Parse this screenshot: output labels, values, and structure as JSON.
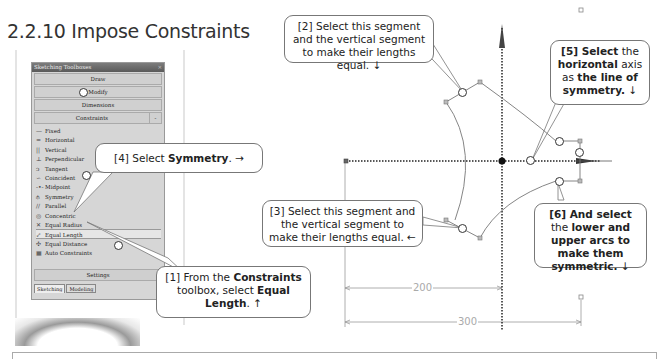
{
  "section": {
    "number": "2.2.10",
    "title": "2.2.10 Impose Constraints"
  },
  "toolbox": {
    "title": "Sketching Toolboxes",
    "close_icon": "close-x-icon",
    "groups": [
      {
        "label": "Draw"
      },
      {
        "label": "Modify"
      },
      {
        "label": "Dimensions"
      },
      {
        "label": "Constraints",
        "expanded": true,
        "collapse_symbol": "-"
      }
    ],
    "constraints": [
      {
        "label": "Fixed",
        "icon": "fixed-icon",
        "glyph": "—"
      },
      {
        "label": "Horizontal",
        "icon": "horizontal-icon",
        "glyph": "="
      },
      {
        "label": "Vertical",
        "icon": "vertical-icon",
        "glyph": "||"
      },
      {
        "label": "Perpendicular",
        "icon": "perpendicular-icon",
        "glyph": "⊥"
      },
      {
        "label": "Tangent",
        "icon": "tangent-icon",
        "glyph": "ↄ"
      },
      {
        "label": "Coincident",
        "icon": "coincident-icon",
        "glyph": "∽"
      },
      {
        "label": "Midpoint",
        "icon": "midpoint-icon",
        "glyph": "-•-"
      },
      {
        "label": "Symmetry",
        "icon": "symmetry-icon",
        "glyph": "⫛"
      },
      {
        "label": "Parallel",
        "icon": "parallel-icon",
        "glyph": "//"
      },
      {
        "label": "Concentric",
        "icon": "concentric-icon",
        "glyph": "◎"
      },
      {
        "label": "Equal Radius",
        "icon": "equal-radius-icon",
        "glyph": "✕"
      },
      {
        "label": "Equal Length",
        "icon": "equal-length-icon",
        "glyph": "⤢",
        "selected": true
      },
      {
        "label": "Equal Distance",
        "icon": "equal-distance-icon",
        "glyph": "✣"
      },
      {
        "label": "Auto Constraints",
        "icon": "auto-constraints-icon",
        "glyph": "▦"
      }
    ],
    "settings_label": "Settings",
    "tabs": [
      {
        "label": "Sketching",
        "active": true
      },
      {
        "label": "Modeling",
        "active": false
      }
    ]
  },
  "callouts": {
    "step1": {
      "prefix": "[1] From the ",
      "b1": "Constraints",
      "mid": " toolbox, select ",
      "b2": "Equal Length",
      "suffix": ". ↑"
    },
    "step2": {
      "text": "[2] Select this segment and the vertical segment to make their lengths equal. ↓"
    },
    "step3": {
      "text": "[3] Select this segment and the vertical segment to make their lengths equal. ←"
    },
    "step4": {
      "prefix": "[4] Select ",
      "b1": "Symmetry",
      "suffix": ". →"
    },
    "step5": {
      "b1": "[5] Select",
      "mid1": " the ",
      "b2": "horizontal",
      "mid2": " axis as ",
      "b3": "the line of symmetry.",
      "suffix": " ↓"
    },
    "step6": {
      "b1": "[6] And select",
      "mid1": " the ",
      "b2": "lower and upper arcs to make them symmetric.",
      "suffix": " ↓"
    }
  },
  "dimensions": {
    "d1": "200",
    "d2": "300"
  },
  "colors": {
    "toolbox_bg": "#d6d6d6",
    "titlebar": "#666666",
    "sketch_line": "#777777",
    "axis": "#222222",
    "dim_line": "#999999"
  }
}
